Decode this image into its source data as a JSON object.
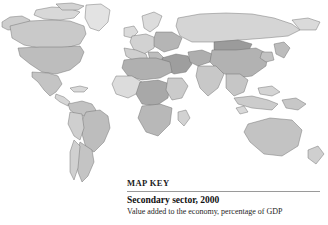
{
  "page": {
    "background_color": "#ffffff",
    "width": 328,
    "height": 225
  },
  "map": {
    "name": "world-choropleth-map",
    "projection": "equirectangular",
    "ocean_color": "#ffffff",
    "border_color": "#6d6d6d",
    "graticule_color": "#c9c9c9",
    "no_data_color": "#f2f2f2",
    "shades": {
      "lightest": "#e6e6e6",
      "light": "#d2d2d2",
      "medium": "#bdbdbd",
      "dark": "#a3a3a3",
      "darkest": "#8a8a8a"
    },
    "regions": [
      {
        "name": "greenland",
        "shade": "#e3e3e3"
      },
      {
        "name": "canada",
        "shade": "#c9c9c9"
      },
      {
        "name": "united-states",
        "shade": "#bdbdbd"
      },
      {
        "name": "mexico",
        "shade": "#c4c4c4"
      },
      {
        "name": "central-america",
        "shade": "#d6d6d6"
      },
      {
        "name": "caribbean",
        "shade": "#d9d9d9"
      },
      {
        "name": "brazil",
        "shade": "#bdbdbd"
      },
      {
        "name": "argentina",
        "shade": "#c4c4c4"
      },
      {
        "name": "chile",
        "shade": "#d0d0d0"
      },
      {
        "name": "peru-bolivia",
        "shade": "#cfcfcf"
      },
      {
        "name": "colombia-venezuela",
        "shade": "#c2c2c2"
      },
      {
        "name": "western-europe",
        "shade": "#d2d2d2"
      },
      {
        "name": "eastern-europe",
        "shade": "#b5b5b5"
      },
      {
        "name": "scandinavia",
        "shade": "#dcdcdc"
      },
      {
        "name": "russia",
        "shade": "#d5d5d5"
      },
      {
        "name": "north-africa",
        "shade": "#b0b0b0"
      },
      {
        "name": "west-africa",
        "shade": "#dcdcdc"
      },
      {
        "name": "central-africa",
        "shade": "#a8a8a8"
      },
      {
        "name": "southern-africa",
        "shade": "#b8b8b8"
      },
      {
        "name": "east-africa",
        "shade": "#cbcbcb"
      },
      {
        "name": "middle-east",
        "shade": "#9e9e9e"
      },
      {
        "name": "india",
        "shade": "#c8c8c8"
      },
      {
        "name": "china",
        "shade": "#b2b2b2"
      },
      {
        "name": "mongolia",
        "shade": "#9b9b9b"
      },
      {
        "name": "southeast-asia",
        "shade": "#c6c6c6"
      },
      {
        "name": "indonesia",
        "shade": "#cccccc"
      },
      {
        "name": "japan",
        "shade": "#bcbcbc"
      },
      {
        "name": "australia",
        "shade": "#c3c3c3"
      },
      {
        "name": "new-zealand",
        "shade": "#cfcfcf"
      }
    ]
  },
  "map_key": {
    "heading": "MAP KEY",
    "title": "Secondary sector, 2000",
    "subtitle": "Value added to the economy, percentage of GDP"
  }
}
